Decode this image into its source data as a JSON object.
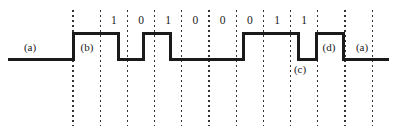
{
  "figure": {
    "type": "digital-waveform-timing-diagram",
    "width": 397,
    "height": 136,
    "background_color": "#ffffff",
    "trace_color": "#1a1a1a",
    "gridline_color": "#333333",
    "trace_width": 3,
    "baseline_y": 59,
    "high_y": 33,
    "signal_start_x": 8,
    "signal_end_x": 389
  },
  "grid": {
    "first_x": 73,
    "spacing": 27.2,
    "count": 12,
    "top_y": 10,
    "bottom_y": 126,
    "dash": "1.6 3.4",
    "positions": [
      73,
      100.2,
      127.4,
      154.6,
      181.8,
      209,
      236.2,
      263.4,
      290.6,
      317.8,
      345,
      372.2
    ]
  },
  "bits": {
    "label_y": 21,
    "values": [
      {
        "text": "1",
        "x": 113.8
      },
      {
        "text": "0",
        "x": 141.0
      },
      {
        "text": "1",
        "x": 168.2
      },
      {
        "text": "0",
        "x": 195.4
      },
      {
        "text": "0",
        "x": 222.6
      },
      {
        "text": "0",
        "x": 249.8
      },
      {
        "text": "1",
        "x": 277.0
      },
      {
        "text": "1",
        "x": 304.2
      }
    ]
  },
  "waveform": {
    "description": "Low-high-low pulse train encoding bit sequence 1 0 1 0 0 0 1 1",
    "bit_sequence": "1 0 1 0 0 0 1 1",
    "levels": [
      "low",
      "high",
      "low",
      "high",
      "low",
      "high",
      "low",
      "high",
      "low"
    ],
    "transitions": [
      {
        "x": 73,
        "edge": "rising"
      },
      {
        "x": 118,
        "edge": "falling"
      },
      {
        "x": 143,
        "edge": "rising"
      },
      {
        "x": 170,
        "edge": "falling"
      },
      {
        "x": 243,
        "edge": "rising"
      },
      {
        "x": 298,
        "edge": "falling"
      },
      {
        "x": 316,
        "edge": "rising"
      },
      {
        "x": 343,
        "edge": "falling"
      }
    ]
  },
  "annotations": [
    {
      "id": "a-left",
      "text": "(a)",
      "x": 30,
      "y": 47
    },
    {
      "id": "b",
      "text": "(b)",
      "x": 87,
      "y": 47
    },
    {
      "id": "c",
      "text": "(c)",
      "x": 300,
      "y": 69
    },
    {
      "id": "d",
      "text": "(d)",
      "x": 329,
      "y": 47
    },
    {
      "id": "a-right",
      "text": "(a)",
      "x": 362,
      "y": 47
    }
  ]
}
